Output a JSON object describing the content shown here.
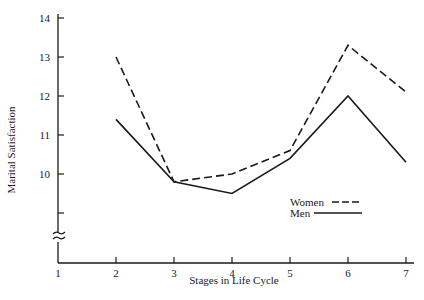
{
  "chart_data": {
    "type": "line",
    "title": "",
    "xlabel": "Stages in Life Cycle",
    "ylabel": "Marital Satisfaction",
    "x": [
      1,
      2,
      3,
      4,
      5,
      6,
      7
    ],
    "x_tick_labels": [
      "1",
      "2",
      "3",
      "4",
      "5",
      "6",
      "7"
    ],
    "y_tick_labels": [
      "10",
      "11",
      "12",
      "13",
      "14"
    ],
    "y_ticks": [
      9,
      10,
      11,
      12,
      13,
      14
    ],
    "ylim": [
      8,
      14
    ],
    "y_axis_break": true,
    "grid": false,
    "legend_position": "lower right (inside plot)",
    "series": [
      {
        "name": "Women",
        "style": "dashed",
        "x": [
          2,
          3,
          4,
          5,
          6,
          7
        ],
        "values": [
          13.0,
          9.8,
          10.0,
          10.6,
          13.3,
          12.1
        ]
      },
      {
        "name": "Men",
        "style": "solid",
        "x": [
          2,
          3,
          4,
          5,
          6,
          7
        ],
        "values": [
          11.4,
          9.8,
          9.5,
          10.4,
          12.0,
          10.3
        ]
      }
    ]
  },
  "legend": {
    "women_label": "Women",
    "men_label": "Men"
  },
  "axes": {
    "x_title": "Stages in Life Cycle",
    "y_title": "Marital Satisfaction"
  },
  "colors": {
    "ink": "#1a1a1a",
    "background": "#ffffff"
  }
}
